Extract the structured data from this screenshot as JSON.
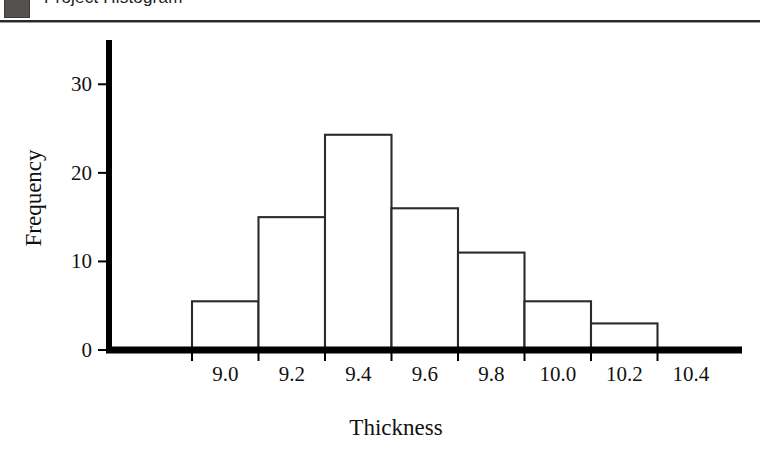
{
  "header": {
    "icon": "solid-square-icon",
    "title": "Project Histogram"
  },
  "chart_data": {
    "type": "bar",
    "title": "Project Histogram",
    "xlabel": "Thickness",
    "ylabel": "Frequency",
    "categories": [
      "9.0-9.2",
      "9.2-9.4",
      "9.4-9.6",
      "9.6-9.8",
      "9.8-10.0",
      "10.0-10.2",
      "10.2-10.4"
    ],
    "bin_edges": [
      9.0,
      9.2,
      9.4,
      9.6,
      9.8,
      10.0,
      10.2,
      10.4
    ],
    "values": [
      5.5,
      15,
      24.3,
      16,
      11,
      5.5,
      3
    ],
    "xticks": [
      "9.0",
      "9.2",
      "9.4",
      "9.6",
      "9.8",
      "10.0",
      "10.2",
      "10.4"
    ],
    "xtick_values": [
      9.0,
      9.2,
      9.4,
      9.6,
      9.8,
      10.0,
      10.2,
      10.4
    ],
    "yticks": [
      "0",
      "10",
      "20",
      "30"
    ],
    "ytick_values": [
      0,
      10,
      20,
      30
    ],
    "ylim": [
      0,
      35
    ],
    "xlim": [
      8.75,
      10.65
    ],
    "grid": false,
    "legend": null,
    "bar_fill": "#ffffff",
    "bar_stroke": "#2b2b2b",
    "axis_color": "#000000"
  }
}
